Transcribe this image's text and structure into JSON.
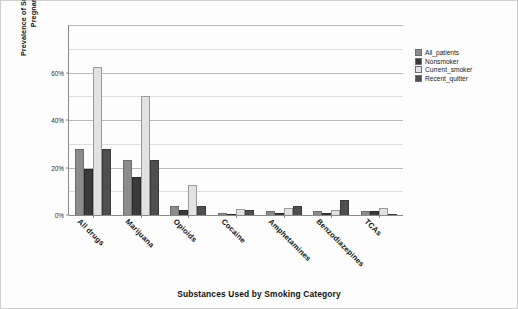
{
  "chart_data": {
    "type": "bar",
    "title": "",
    "xlabel": "Substances Used by Smoking Category",
    "ylabel": "Prevalence of Substance Used by Pregnant Women",
    "categories": [
      "All drugs",
      "Marijuana",
      "Opioids",
      "Cocaine",
      "Amphetamines",
      "Benzodiazepines",
      "TCAs"
    ],
    "series": [
      {
        "name": "All_patients",
        "color": "#8c8c8c",
        "values": [
          28,
          23,
          4,
          1,
          1.5,
          1.5,
          1.5
        ]
      },
      {
        "name": "Nonsmoker",
        "color": "#3a3a3a",
        "values": [
          19.5,
          16,
          2,
          0.5,
          1,
          1,
          1.5
        ]
      },
      {
        "name": "Current_smoker",
        "color": "#e2e2e2",
        "values": [
          62.5,
          50,
          12.5,
          2.5,
          3,
          2,
          3
        ]
      },
      {
        "name": "Recent_quitter",
        "color": "#4f4f4f",
        "values": [
          28,
          23,
          4,
          2,
          4,
          6.5,
          0.5
        ]
      }
    ],
    "ylim": [
      0,
      80
    ],
    "yticks": [
      0,
      20,
      40,
      60
    ],
    "ytick_labels": [
      "0%",
      "20%",
      "40%",
      "60%"
    ],
    "gridlines": [
      10,
      20,
      30,
      40,
      50,
      60,
      70,
      80
    ],
    "grid": true,
    "legend_position": "right"
  },
  "legend": {
    "items": [
      {
        "label": "All_patients"
      },
      {
        "label": "Nonsmoker"
      },
      {
        "label": "Current_smoker"
      },
      {
        "label": "Recent_quitter"
      }
    ]
  }
}
